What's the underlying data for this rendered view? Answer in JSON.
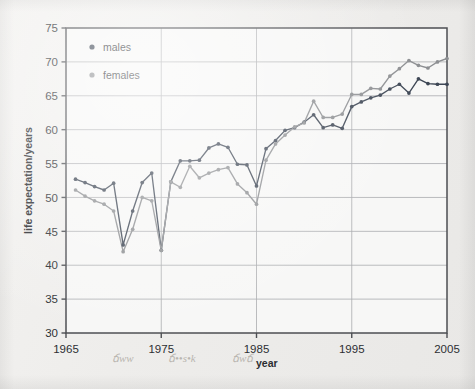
{
  "figure": {
    "kind": "scanned-line-chart",
    "paper_color": "#eeedeb",
    "plot_bg_color": "#f7f7f6",
    "frame_color": "#4c4e52",
    "grid_color": "#a9abaf"
  },
  "legend": {
    "position": "top-left-inside",
    "entries": [
      {
        "label": "males",
        "color": "#3d4654",
        "marker": "filled-circle"
      },
      {
        "label": "females",
        "color": "#8d8f92",
        "marker": "filled-circle"
      }
    ]
  },
  "axes": {
    "x": {
      "title": "year",
      "min": 1965,
      "max": 2005,
      "tick_step": 10,
      "tick_labels": [
        "1965",
        "1975",
        "1985",
        "1995",
        "2005"
      ],
      "grid": true
    },
    "y": {
      "title": "life expectation/years",
      "min": 30,
      "max": 75,
      "tick_step": 5,
      "tick_labels": [
        "30",
        "35",
        "40",
        "45",
        "50",
        "55",
        "60",
        "65",
        "70",
        "75"
      ],
      "grid": true
    }
  },
  "annotations": {
    "pencil_marks": [
      "ճww",
      "ճ••­s•k",
      "ճwճ"
    ],
    "note": "faint illegible handwritten pencil marks along the bottom margin"
  },
  "chart_data": {
    "type": "line",
    "title": "",
    "subtitle": "",
    "xlabel": "year",
    "ylabel": "life expectation/years",
    "xlim": [
      1965,
      2005
    ],
    "ylim": [
      30,
      75
    ],
    "grid": true,
    "legend_position": "upper left",
    "marker": "filled-circle",
    "x": [
      1966,
      1967,
      1968,
      1969,
      1970,
      1971,
      1972,
      1973,
      1974,
      1975,
      1976,
      1977,
      1978,
      1979,
      1980,
      1981,
      1982,
      1983,
      1984,
      1985,
      1986,
      1987,
      1988,
      1989,
      1990,
      1991,
      1992,
      1993,
      1994,
      1995,
      1996,
      1997,
      1998,
      1999,
      2000,
      2001,
      2002,
      2003,
      2004,
      2005
    ],
    "series": [
      {
        "name": "males",
        "color": "#3d4654",
        "values": [
          52.7,
          52.2,
          51.6,
          51.1,
          52.1,
          43.0,
          48.0,
          52.2,
          53.6,
          42.2,
          52.3,
          55.4,
          55.4,
          55.5,
          57.3,
          57.9,
          57.4,
          54.9,
          54.8,
          51.7,
          57.2,
          58.4,
          59.9,
          60.3,
          61.1,
          62.2,
          60.3,
          60.7,
          60.2,
          63.4,
          64.1,
          64.7,
          65.1,
          66.0,
          66.7,
          65.4,
          67.5,
          66.8,
          66.7,
          66.7
        ]
      },
      {
        "name": "females",
        "color": "#8d8f92",
        "values": [
          51.1,
          50.2,
          49.5,
          49.0,
          48.0,
          42.0,
          45.3,
          50.0,
          49.5,
          42.2,
          52.3,
          51.5,
          54.6,
          52.9,
          53.6,
          54.1,
          54.4,
          52.0,
          50.7,
          49.0,
          55.5,
          57.9,
          59.2,
          60.4,
          61.0,
          64.2,
          61.8,
          61.8,
          62.3,
          65.2,
          65.2,
          66.1,
          66.0,
          67.9,
          69.0,
          70.2,
          69.5,
          69.1,
          70.0,
          70.5
        ]
      }
    ]
  }
}
